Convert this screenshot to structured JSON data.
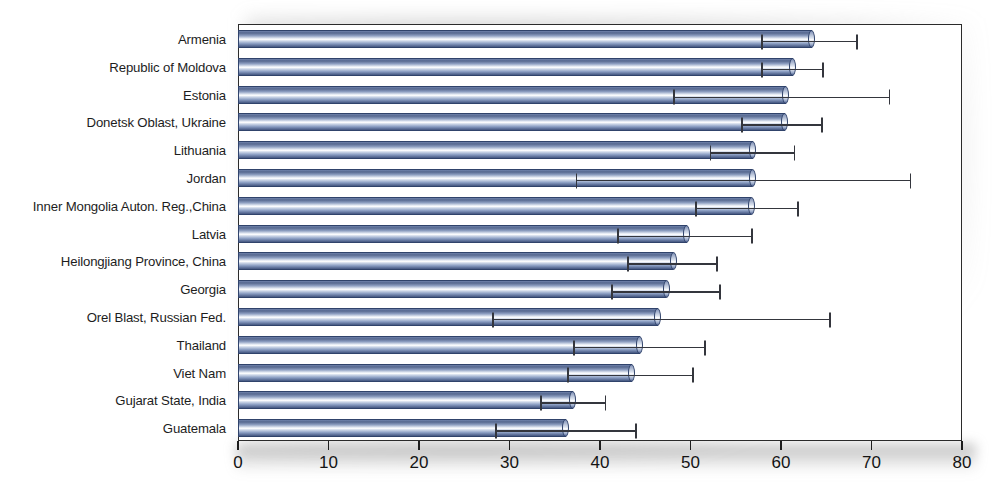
{
  "chart_data": {
    "type": "bar",
    "orientation": "horizontal",
    "title": "",
    "subtitle": "",
    "xlabel": "",
    "ylabel": "",
    "xlim": [
      0,
      80
    ],
    "xticks": [
      0,
      10,
      20,
      30,
      40,
      50,
      60,
      70,
      80
    ],
    "xtick_labels": [
      "0",
      "10",
      "20",
      "30",
      "40",
      "50",
      "60",
      "70",
      "80"
    ],
    "grid": false,
    "legend": null,
    "error_bars": "horizontal confidence interval",
    "categories": [
      "Armenia",
      "Republic of Moldova",
      "Estonia",
      "Donetsk Oblast, Ukraine",
      "Lithuania",
      "Jordan",
      "Inner Mongolia Auton. Reg.,China",
      "Latvia",
      "Heilongjiang Province, China",
      "Georgia",
      "Orel Blast, Russian Fed.",
      "Thailand",
      "Viet Nam",
      "Gujarat State, India",
      "Guatemala"
    ],
    "values": [
      63.4,
      61.3,
      60.5,
      60.4,
      56.9,
      56.8,
      56.7,
      49.6,
      48.1,
      47.3,
      46.4,
      44.4,
      43.5,
      37.0,
      36.2
    ],
    "error_low": [
      57.9,
      57.9,
      48.2,
      55.7,
      52.2,
      37.4,
      50.6,
      42.0,
      43.1,
      41.3,
      28.2,
      37.1,
      36.5,
      33.5,
      28.5
    ],
    "error_high": [
      68.4,
      64.6,
      72.0,
      64.5,
      61.5,
      74.3,
      61.9,
      56.8,
      52.9,
      53.3,
      65.4,
      51.6,
      50.3,
      40.6,
      44.0
    ],
    "series": [
      {
        "name": "value",
        "values": [
          63.4,
          61.3,
          60.5,
          60.4,
          56.9,
          56.8,
          56.7,
          49.6,
          48.1,
          47.3,
          46.4,
          44.4,
          43.5,
          37.0,
          36.2
        ]
      }
    ],
    "colors": {
      "bar_fill": "#8fa0c2",
      "bar_edge": "#30436b",
      "bar_highlight": "#ffffff",
      "bar_shadow": "#44567f",
      "error_bar": "#34363d",
      "axis": "#1d1d1d",
      "background": "#ffffff"
    }
  }
}
